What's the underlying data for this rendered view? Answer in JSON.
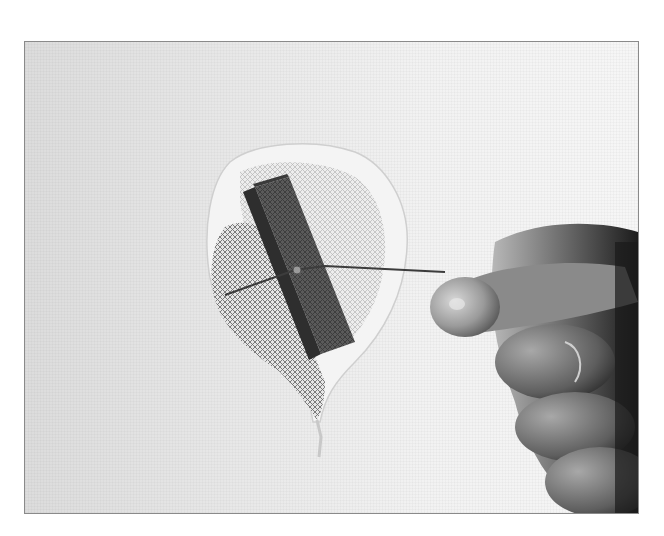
{
  "photo": {
    "subject": "drywall-hole-repair",
    "elements": [
      "drywall-wall",
      "hole-with-torn-paper-edge",
      "mesh-patch",
      "wooden-backer-strip",
      "wire-pull-string",
      "hand-pulling-wire"
    ]
  },
  "colors": {
    "frame_border": "#8a8a8a",
    "wall_left": "#dcdcdc",
    "wall_right": "#f6f6f6",
    "backer_strip": "#4a4a4a",
    "hand_shadow": "#2a2a2a"
  }
}
